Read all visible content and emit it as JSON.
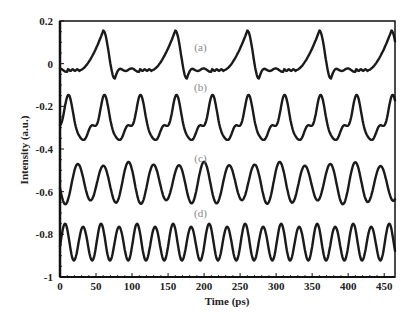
{
  "chart_data": {
    "type": "line",
    "title": "",
    "xlabel": "Time (ps)",
    "ylabel": "Intensity (a.u.)",
    "xlim": [
      0,
      465
    ],
    "ylim": [
      -1,
      0.2
    ],
    "xticks": [
      0,
      50,
      100,
      150,
      200,
      250,
      300,
      350,
      400,
      450
    ],
    "xtick_labels": [
      "0",
      "50",
      "100",
      "150",
      "200",
      "250",
      "300",
      "350",
      "400",
      "450"
    ],
    "yticks": [
      0.2,
      0,
      -0.2,
      -0.4,
      -0.6,
      -0.8,
      -1
    ],
    "ytick_labels": [
      "0.2",
      "0",
      "-0.2",
      "-0.4",
      "-0.6",
      "-0.8",
      "-1"
    ],
    "grid": false,
    "legend": "none",
    "annotations": [
      {
        "text": "(a)",
        "x": 195,
        "y": 0.08
      },
      {
        "text": "(b)",
        "x": 195,
        "y": -0.11
      },
      {
        "text": "(c)",
        "x": 195,
        "y": -0.44
      },
      {
        "text": "(d)",
        "x": 195,
        "y": -0.7
      }
    ],
    "series": [
      {
        "name": "(a)",
        "description": "Pulse train, period ~100 ps, peaks ~0.16 at t~60,160,260,360,460; baseline ~-0.03, dips ~-0.07",
        "baseline": -0.03,
        "period_ps": 100,
        "peak_times": [
          60,
          160,
          260,
          360,
          460
        ],
        "peak_value": 0.155,
        "dip_value": -0.07
      },
      {
        "name": "(b)",
        "description": "Period ~50 ps, main peaks ~-0.16, secondary bumps ~-0.3, troughs ~-0.37",
        "baseline": -0.28,
        "period_ps": 50,
        "first_peak_ps": 10,
        "peak_value": -0.16,
        "trough_value": -0.37
      },
      {
        "name": "(c)",
        "description": "Period ~35 ps, peaks ~-0.45 to -0.5, troughs ~-0.65",
        "baseline": -0.56,
        "period_ps": 35,
        "first_peak_ps": 25,
        "peak_value": -0.46,
        "trough_value": -0.66
      },
      {
        "name": "(d)",
        "description": "Period ~25 ps, peaks ~-0.75 to -0.78, troughs ~-0.92",
        "baseline": -0.84,
        "period_ps": 25,
        "first_peak_ps": 7,
        "peak_value": -0.75,
        "trough_value": -0.93
      }
    ]
  }
}
